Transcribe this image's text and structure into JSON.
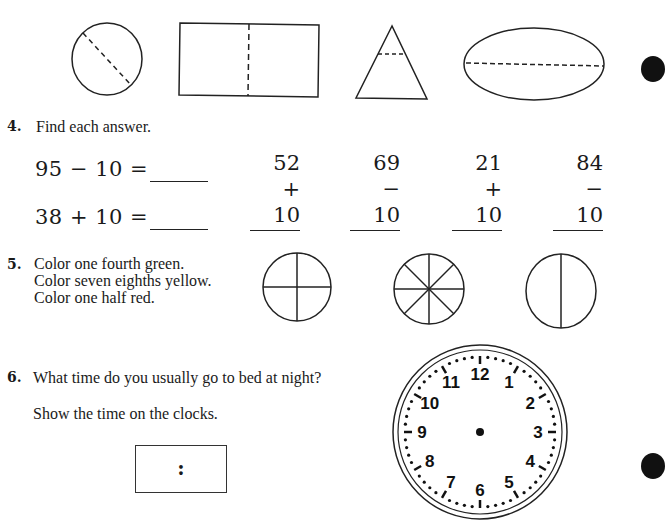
{
  "top_shapes": [
    {
      "shape": "circle",
      "fold_line": "diagonal dashed"
    },
    {
      "shape": "rectangle",
      "fold_line": "vertical dashed"
    },
    {
      "shape": "triangle",
      "fold_line": "horizontal dashed near apex"
    },
    {
      "shape": "ellipse",
      "fold_line": "horizontal dashed"
    }
  ],
  "q4": {
    "number": "4.",
    "prompt": "Find each answer.",
    "horizontal": [
      {
        "expr": "95 − 10 =",
        "answer": ""
      },
      {
        "expr": "38 + 10 =",
        "answer": ""
      }
    ],
    "vertical": [
      {
        "top": "52",
        "bottom": "+ 10"
      },
      {
        "top": "69",
        "bottom": "− 10"
      },
      {
        "top": "21",
        "bottom": "+ 10"
      },
      {
        "top": "84",
        "bottom": "− 10"
      }
    ]
  },
  "q5": {
    "number": "5.",
    "lines": [
      "Color one fourth green.",
      "Color seven eighths yellow.",
      "Color one half red."
    ],
    "circles": [
      {
        "parts": 4
      },
      {
        "parts": 8
      },
      {
        "parts": 2
      }
    ]
  },
  "q6": {
    "number": "6.",
    "prompt": "What time do you usually go to bed at night?",
    "instruction": "Show the time on the clocks.",
    "digital_separator": ":",
    "clock_numbers": [
      "12",
      "1",
      "2",
      "3",
      "4",
      "5",
      "6",
      "7",
      "8",
      "9",
      "10",
      "11"
    ]
  }
}
